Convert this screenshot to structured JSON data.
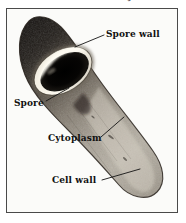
{
  "figure": {
    "running_header": "Diagnostic Protozoa",
    "frame": {
      "border_color": "#4a4a4a",
      "background": "#fdfdfd"
    },
    "palette": {
      "dark_cell_top": "#16120f",
      "mid_gray": "#8a8378",
      "light_gray": "#c9c4ba",
      "spore_core": "#050403",
      "spore_wall_highlight": "#f2efe6",
      "background": "#fbfbf9",
      "label_text": "#111111",
      "leader_line": "#1a1a1a"
    },
    "labels": [
      {
        "id": "spore-wall",
        "text": "Spore wall"
      },
      {
        "id": "spore",
        "text": "Spore"
      },
      {
        "id": "cytoplasm",
        "text": "Cytoplasm"
      },
      {
        "id": "cell-wall",
        "text": "Cell wall"
      }
    ]
  }
}
